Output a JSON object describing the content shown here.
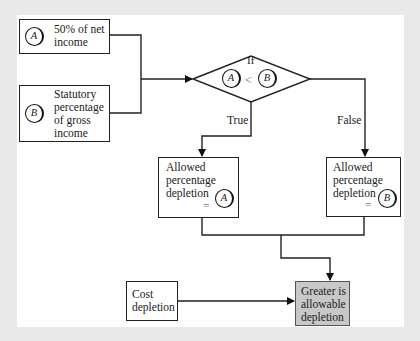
{
  "diagram": {
    "type": "flowchart",
    "inputs": {
      "a": {
        "symbol": "A",
        "label_line1": "50% of net",
        "label_line2": "income"
      },
      "b": {
        "symbol": "B",
        "label_line1": "Statutory",
        "label_line2": "percentage",
        "label_line3": "of gross",
        "label_line4": "income"
      }
    },
    "decision": {
      "label": "If",
      "left_symbol": "A",
      "operator": "<",
      "right_symbol": "B"
    },
    "branches": {
      "true_label": "True",
      "false_label": "False"
    },
    "result_a": {
      "line1": "Allowed",
      "line2": "percentage",
      "line3": "depletion",
      "equals": "=",
      "symbol": "A"
    },
    "result_b": {
      "line1": "Allowed",
      "line2": "percentage",
      "line3": "depletion",
      "equals": "=",
      "symbol": "B"
    },
    "cost": {
      "line1": "Cost",
      "line2": "depletion"
    },
    "final": {
      "line1": "Greater is",
      "line2": "allowable",
      "line3": "depletion",
      "fill": "#c8c8c8"
    }
  }
}
